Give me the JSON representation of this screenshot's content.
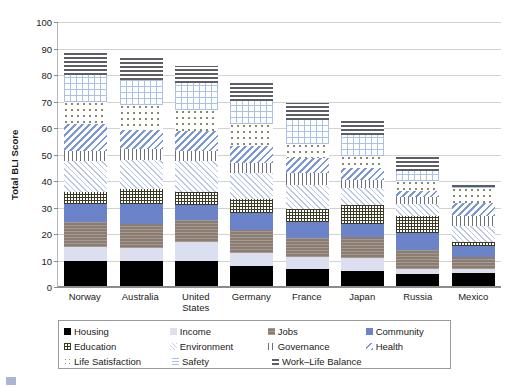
{
  "chart_data": {
    "type": "bar",
    "title": "",
    "subtitle": "",
    "xlabel": "",
    "ylabel": "Total BLI Score",
    "ylim": [
      0,
      100
    ],
    "yticks": [
      0,
      10,
      20,
      30,
      40,
      50,
      60,
      70,
      80,
      90,
      100
    ],
    "grid": true,
    "stacked": true,
    "legend_position": "bottom",
    "legend_columns": 4,
    "categories": [
      "Norway",
      "Australia",
      "United States",
      "Germany",
      "France",
      "Japan",
      "Russia",
      "Mexico"
    ],
    "series": [
      {
        "name": "Housing",
        "pattern": "solid-black",
        "color": "#000000",
        "values": [
          9.5,
          9.5,
          9.5,
          7.5,
          6.5,
          5.5,
          4.5,
          5.0
        ]
      },
      {
        "name": "Income",
        "pattern": "solid-light-gray",
        "color": "#dcdfef",
        "values": [
          5.2,
          4.8,
          7.0,
          5.0,
          4.5,
          5.0,
          2.0,
          1.5
        ]
      },
      {
        "name": "Jobs",
        "pattern": "gray-horizontal",
        "color": "#8b7d72",
        "values": [
          9.3,
          9.2,
          8.5,
          8.5,
          7.0,
          8.0,
          7.0,
          4.5
        ]
      },
      {
        "name": "Community",
        "pattern": "solid-blue",
        "color": "#6b83c9",
        "values": [
          7.0,
          7.5,
          5.5,
          6.5,
          6.0,
          5.0,
          6.5,
          4.0
        ]
      },
      {
        "name": "Education",
        "pattern": "dark-crosshatch",
        "color": "#3b3b23",
        "values": [
          4.5,
          5.5,
          5.0,
          5.5,
          5.0,
          7.0,
          6.5,
          1.5
        ]
      },
      {
        "name": "Environment",
        "pattern": "light-diagonal",
        "color": "#b9c8e6",
        "values": [
          11.5,
          11.0,
          11.5,
          9.5,
          9.0,
          6.5,
          4.5,
          6.0
        ]
      },
      {
        "name": "Governance",
        "pattern": "vertical-lines",
        "color": "#6f6f7e",
        "values": [
          4.0,
          4.2,
          4.0,
          4.0,
          4.5,
          3.0,
          2.5,
          4.0
        ]
      },
      {
        "name": "Health",
        "pattern": "blue-diagonal",
        "color": "#7b97d4",
        "values": [
          10.0,
          7.0,
          7.5,
          6.5,
          6.0,
          4.5,
          2.5,
          5.0
        ]
      },
      {
        "name": "Life Satisfaction",
        "pattern": "dots",
        "color": "#8a8a6b",
        "values": [
          8.5,
          9.5,
          8.0,
          8.0,
          5.0,
          4.5,
          3.5,
          5.5
        ]
      },
      {
        "name": "Safety",
        "pattern": "blue-grid",
        "color": "#aac2e8",
        "values": [
          10.0,
          9.5,
          10.0,
          9.0,
          9.0,
          8.0,
          4.0,
          0.5
        ]
      },
      {
        "name": "Work–Life Balance",
        "pattern": "dark-horizontal",
        "color": "#5d5d66",
        "values": [
          8.5,
          8.5,
          6.5,
          6.5,
          6.5,
          5.5,
          5.5,
          0.5
        ]
      }
    ],
    "totals": [
      88.0,
      86.2,
      83.0,
      76.5,
      69.0,
      62.5,
      49.0,
      38.0
    ]
  },
  "legend": {
    "rows": [
      [
        {
          "label": "Housing",
          "series_index": 0
        },
        {
          "label": "Income",
          "series_index": 1
        },
        {
          "label": "Jobs",
          "series_index": 2
        },
        {
          "label": "Community",
          "series_index": 3
        }
      ],
      [
        {
          "label": "Education",
          "series_index": 4
        },
        {
          "label": "Environment",
          "series_index": 5
        },
        {
          "label": "Governance",
          "series_index": 6
        },
        {
          "label": "Health",
          "series_index": 7
        }
      ],
      [
        {
          "label": "Life Satisfaction",
          "series_index": 8
        },
        {
          "label": "Safety",
          "series_index": 9
        },
        {
          "label": "Work–Life Balance",
          "series_index": 10
        }
      ]
    ]
  }
}
